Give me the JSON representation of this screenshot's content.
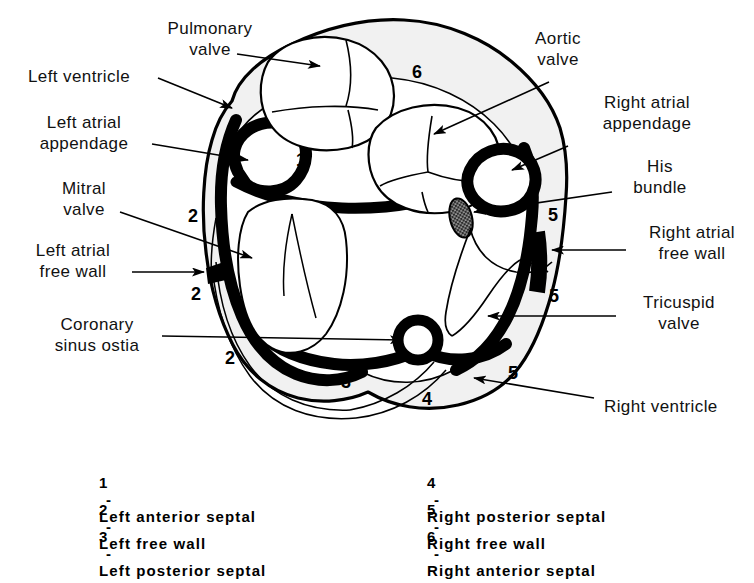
{
  "figure": {
    "colors": {
      "ink": "#000000",
      "background": "#ffffff",
      "epicardial_fill": "#f1f1f1",
      "chamber_fill": "#ffffff",
      "his_bundle_fill": "#3a3a3a"
    }
  },
  "callouts": [
    {
      "id": "pulmonary-valve",
      "text": "Pulmonary\nvalve",
      "align": "center"
    },
    {
      "id": "left-ventricle",
      "text": "Left ventricle",
      "align": "left"
    },
    {
      "id": "left-atrial-appendage",
      "text": "Left atrial\nappendage",
      "align": "center"
    },
    {
      "id": "mitral-valve",
      "text": "Mitral\nvalve",
      "align": "center"
    },
    {
      "id": "left-atrial-free-wall",
      "text": "Left atrial\nfree wall",
      "align": "center"
    },
    {
      "id": "coronary-sinus-ostia",
      "text": "Coronary\nsinus ostia",
      "align": "center"
    },
    {
      "id": "aortic-valve",
      "text": "Aortic\nvalve",
      "align": "center"
    },
    {
      "id": "right-atrial-appendage",
      "text": "Right atrial\nappendage",
      "align": "center"
    },
    {
      "id": "his-bundle",
      "text": "His\nbundle",
      "align": "center"
    },
    {
      "id": "right-atrial-free-wall",
      "text": "Right atrial\nfree wall",
      "align": "center"
    },
    {
      "id": "tricuspid-valve",
      "text": "Tricuspid\nvalve",
      "align": "center"
    },
    {
      "id": "right-ventricle",
      "text": "Right ventricle",
      "align": "left"
    }
  ],
  "region_markers": [
    {
      "label": "1"
    },
    {
      "label": "2"
    },
    {
      "label": "2"
    },
    {
      "label": "2"
    },
    {
      "label": "3"
    },
    {
      "label": "4"
    },
    {
      "label": "5"
    },
    {
      "label": "5"
    },
    {
      "label": "5"
    },
    {
      "label": "6"
    }
  ],
  "legend": {
    "left_column": [
      {
        "number": "1",
        "sep": "-",
        "name": "Left anterior septal"
      },
      {
        "number": "2",
        "sep": "-",
        "name": "Left free wall"
      },
      {
        "number": "3",
        "sep": "-",
        "name": "Left posterior septal"
      }
    ],
    "right_column": [
      {
        "number": "4",
        "sep": "-",
        "name": "Right posterior septal"
      },
      {
        "number": "5",
        "sep": "-",
        "name": "Right free wall"
      },
      {
        "number": "6",
        "sep": "-",
        "name": "Right anterior septal"
      }
    ]
  }
}
